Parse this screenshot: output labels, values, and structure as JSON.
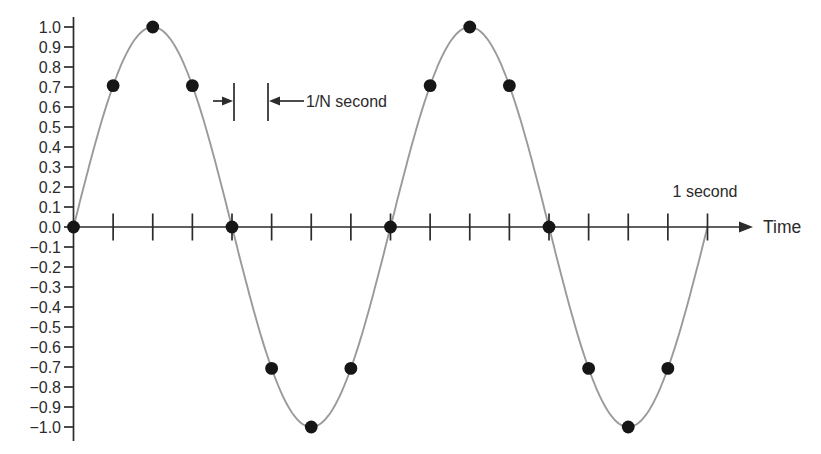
{
  "figure": {
    "background": "#ffffff",
    "labels": {
      "time_axis": "Time",
      "one_second": "1 second",
      "sample_interval": "1/N second"
    }
  },
  "chart_data": {
    "type": "line",
    "title": "",
    "xlabel": "Time",
    "ylabel": "",
    "x_domain_seconds": [
      0,
      1
    ],
    "ylim": [
      -1.0,
      1.0
    ],
    "y_tick_step": 0.1,
    "y_tick_labels": [
      "1.0",
      "0.9",
      "0.8",
      "0.7",
      "0.6",
      "0.5",
      "0.4",
      "0.3",
      "0.2",
      "0.1",
      "0.0",
      "−0.1",
      "−0.2",
      "−0.3",
      "−0.4",
      "−0.5",
      "−0.6",
      "−0.7",
      "−0.8",
      "−0.9",
      "−1.0"
    ],
    "x_ticks_count": 16,
    "grid": false,
    "legend": "none",
    "annotations": [
      "1/N second",
      "1 second"
    ],
    "colors": {
      "curve": "#9a9a9a",
      "ink": "#2b2b2b",
      "dot": "#161616"
    },
    "series": [
      {
        "name": "continuous-sine-signal",
        "kind": "sine",
        "cycles_per_second": 2,
        "amplitude": 1.0,
        "color": "#9a9a9a"
      },
      {
        "name": "samples",
        "kind": "scatter",
        "color": "#161616",
        "t": [
          0,
          0.0625,
          0.125,
          0.1875,
          0.25,
          0.3125,
          0.375,
          0.4375,
          0.5,
          0.5625,
          0.625,
          0.6875,
          0.75,
          0.8125,
          0.875,
          0.9375
        ],
        "values": [
          0,
          0.707,
          1,
          0.707,
          0,
          -0.707,
          -1,
          -0.707,
          0,
          0.707,
          1,
          0.707,
          0,
          -0.707,
          -1,
          -0.707
        ]
      }
    ]
  }
}
